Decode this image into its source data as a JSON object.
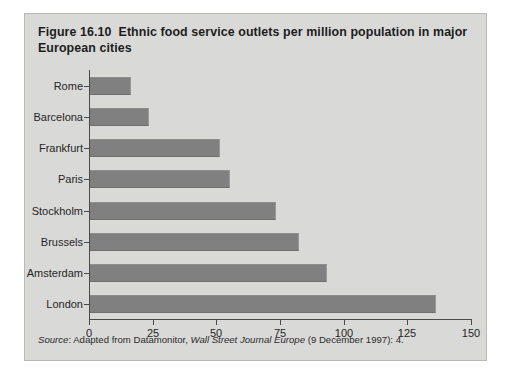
{
  "figure": {
    "number": "Figure 16.10",
    "title": "Ethnic food service outlets per million population in major European cities",
    "panel_color": "#d9d9d7",
    "bar_color": "#808080",
    "axis_color": "#4a4a4a"
  },
  "source": {
    "label": "Source",
    "separator": ": ",
    "text_before": "Adapted from Datamonitor, ",
    "publication": "Wall Street Journal Europe",
    "text_after": " (9 December 1997): 4."
  },
  "chart_data": {
    "type": "bar",
    "orientation": "horizontal",
    "xlabel": "",
    "ylabel": "",
    "categories": [
      "Rome",
      "Barcelona",
      "Frankfurt",
      "Paris",
      "Stockholm",
      "Brussels",
      "Amsterdam",
      "London"
    ],
    "values": [
      16,
      23,
      51,
      55,
      73,
      82,
      93,
      136
    ],
    "xlim": [
      0,
      150
    ],
    "xticks": [
      0,
      25,
      50,
      75,
      100,
      125,
      150
    ],
    "xtick_labels": [
      "0",
      "25",
      "50",
      "75",
      "100",
      "125",
      "150"
    ],
    "grid": false,
    "legend": false
  }
}
